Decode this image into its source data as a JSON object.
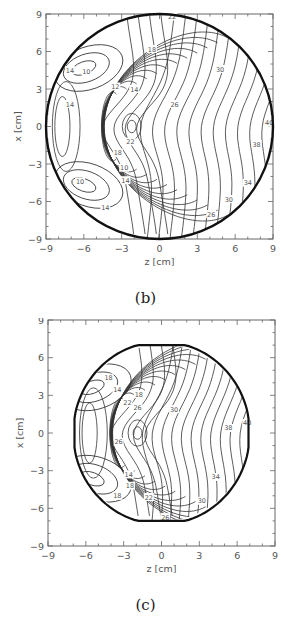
{
  "chart_data": [
    {
      "type": "contour",
      "panel_label": "(b)",
      "title": "",
      "xlabel": "z [cm]",
      "ylabel": "x [cm]",
      "xlim": [
        -9,
        9
      ],
      "ylim": [
        -9,
        9
      ],
      "xticks": [
        "-9",
        "-6",
        "-3",
        "0",
        "3",
        "6",
        "9"
      ],
      "yticks": [
        "9",
        "6",
        "3",
        "0",
        "-3",
        "-6",
        "-9"
      ],
      "grid": false,
      "boundary": {
        "shape": "circle",
        "radius_cm": 9
      },
      "contour_labels": [
        {
          "text": "22",
          "z": 1.0,
          "x": 8.8
        },
        {
          "text": "18",
          "z": -0.6,
          "x": 6.2
        },
        {
          "text": "14",
          "z": -7.1,
          "x": 4.5
        },
        {
          "text": "10",
          "z": -5.8,
          "x": 4.4
        },
        {
          "text": "12",
          "z": -3.5,
          "x": 3.2
        },
        {
          "text": "14",
          "z": -2.0,
          "x": 3.0
        },
        {
          "text": "14",
          "z": -7.1,
          "x": 1.8
        },
        {
          "text": "26",
          "z": 1.2,
          "x": 1.8
        },
        {
          "text": "30",
          "z": 4.8,
          "x": 4.6
        },
        {
          "text": "22",
          "z": -2.3,
          "x": -1.2
        },
        {
          "text": "18",
          "z": -3.3,
          "x": -2.1
        },
        {
          "text": "10",
          "z": -2.8,
          "x": -3.3
        },
        {
          "text": "14",
          "z": -2.7,
          "x": -4.3
        },
        {
          "text": "10",
          "z": -6.3,
          "x": -4.4
        },
        {
          "text": "14",
          "z": -4.3,
          "x": -6.5
        },
        {
          "text": "26",
          "z": 4.1,
          "x": -7.0
        },
        {
          "text": "30",
          "z": 5.5,
          "x": -5.8
        },
        {
          "text": "34",
          "z": 7.0,
          "x": -4.5
        },
        {
          "text": "38",
          "z": 7.7,
          "x": -1.4
        },
        {
          "text": "40",
          "z": 8.7,
          "x": 0.3
        }
      ],
      "contour_levels": [
        10,
        12,
        14,
        16,
        18,
        20,
        22,
        24,
        26,
        28,
        30,
        32,
        34,
        36,
        38,
        40
      ],
      "features": {
        "local_extremum": {
          "z": -2.2,
          "x": 0.0
        },
        "steep_gradient_near_z": -4.8
      }
    },
    {
      "type": "contour",
      "panel_label": "(c)",
      "title": "",
      "xlabel": "z [cm]",
      "ylabel": "x [cm]",
      "xlim": [
        -9,
        9
      ],
      "ylim": [
        -9,
        9
      ],
      "xticks": [
        "-9",
        "-6",
        "-3",
        "0",
        "3",
        "6",
        "9"
      ],
      "yticks": [
        "9",
        "6",
        "3",
        "0",
        "-3",
        "-6",
        "-9"
      ],
      "grid": false,
      "boundary": {
        "shape": "truncated-circle",
        "radius_cm": 7,
        "flat_top_bottom_at": 7
      },
      "contour_labels": [
        {
          "text": "18",
          "z": -4.2,
          "x": 4.4
        },
        {
          "text": "14",
          "z": -3.5,
          "x": 3.5
        },
        {
          "text": "18",
          "z": -1.8,
          "x": 3.1
        },
        {
          "text": "22",
          "z": -2.7,
          "x": 2.4
        },
        {
          "text": "26",
          "z": -1.9,
          "x": 2.0
        },
        {
          "text": "30",
          "z": 1.0,
          "x": 1.9
        },
        {
          "text": "26",
          "z": -3.4,
          "x": -0.7
        },
        {
          "text": "14",
          "z": -2.6,
          "x": -3.3
        },
        {
          "text": "18",
          "z": -2.5,
          "x": -4.2
        },
        {
          "text": "18",
          "z": -3.5,
          "x": -5.0
        },
        {
          "text": "22",
          "z": -1.0,
          "x": -5.1
        },
        {
          "text": "26",
          "z": 0.3,
          "x": -6.7
        },
        {
          "text": "30",
          "z": 3.2,
          "x": -5.4
        },
        {
          "text": "34",
          "z": 4.3,
          "x": -3.5
        },
        {
          "text": "38",
          "z": 5.3,
          "x": 0.4
        },
        {
          "text": "40",
          "z": 6.8,
          "x": 0.8
        }
      ],
      "contour_levels": [
        14,
        16,
        18,
        20,
        22,
        24,
        26,
        28,
        30,
        32,
        34,
        36,
        38,
        40
      ],
      "features": {
        "local_extremum": {
          "z": -1.9,
          "x": 0.0
        },
        "steep_gradient_near_z": -4.3
      }
    }
  ],
  "panels": {
    "b": {
      "caption": "(b)",
      "xlabel": "z [cm]",
      "ylabel": "x [cm]"
    },
    "c": {
      "caption": "(c)",
      "xlabel": "z [cm]",
      "ylabel": "x [cm]"
    }
  }
}
